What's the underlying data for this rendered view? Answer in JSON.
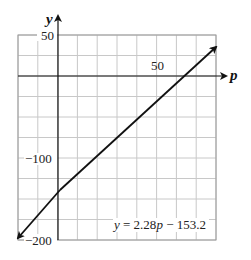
{
  "chart_data": {
    "type": "line",
    "title": "",
    "xlabel": "p",
    "ylabel": "y",
    "xlim": [
      -20,
      80
    ],
    "ylim": [
      -200,
      50
    ],
    "grid": true,
    "x_grid_step": 10,
    "y_grid_step": 25,
    "x_tick_labels": [
      {
        "value": 50,
        "label": "50"
      }
    ],
    "y_tick_labels": [
      {
        "value": 50,
        "label": "50"
      },
      {
        "value": -100,
        "label": "−100"
      },
      {
        "value": -200,
        "label": "−200"
      }
    ],
    "series": [
      {
        "name": "y = 2.28p − 153.2",
        "slope": 2.28,
        "intercept": -153.2,
        "x": [
          -20,
          80
        ],
        "y": [
          -198.8,
          29.2
        ],
        "arrows_both_ends": true
      }
    ],
    "annotations": [
      {
        "text": "y = 2.28p − 153.2",
        "position": "lower-right"
      }
    ],
    "colors": {
      "line": "#111111",
      "grid": "#c8c8c8",
      "axis": "#111111",
      "border": "#999999"
    }
  },
  "labels": {
    "x_axis": "p",
    "y_axis": "y",
    "tick_50_y": "50",
    "tick_neg100_y": "−100",
    "tick_neg200_y": "−200",
    "tick_50_x": "50",
    "equation_prefix": "y",
    "equation_mid": " = 2.28",
    "equation_var": "p",
    "equation_suffix": " − 153.2"
  }
}
